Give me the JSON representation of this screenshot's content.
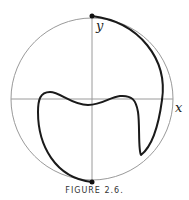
{
  "figure": {
    "caption": "FIGURE 2.6.",
    "axes": {
      "x_label": "x",
      "y_label": "y"
    },
    "colors": {
      "circle": "#9a9a9a",
      "axes": "#9a9a9a",
      "curve": "#1a1a1a",
      "points": "#111111"
    },
    "points": [
      {
        "name": "top",
        "x": 92,
        "y": 16
      },
      {
        "name": "bottom",
        "x": 92,
        "y": 182
      }
    ]
  }
}
